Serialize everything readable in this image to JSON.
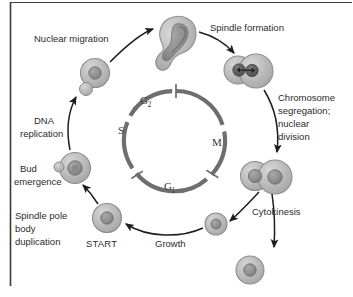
{
  "figure": {
    "background_color": "#ffffff",
    "border_color": "#3b3b3b"
  },
  "cycle_ring": {
    "name": "cell-cycle-ring",
    "color": "#6e6e6e",
    "tick_color": "#6e6e6e",
    "phases": [
      {
        "id": "g2",
        "label": "G",
        "subscript": "2"
      },
      {
        "id": "m",
        "label": "M",
        "subscript": ""
      },
      {
        "id": "g1",
        "label": "G",
        "subscript": "1"
      },
      {
        "id": "s",
        "label": "S",
        "subscript": ""
      }
    ]
  },
  "stage_labels": [
    {
      "id": "nuclear-migration",
      "lines": [
        "Nuclear migration"
      ]
    },
    {
      "id": "spindle-formation",
      "lines": [
        "Spindle formation"
      ]
    },
    {
      "id": "chromosome-segregation",
      "lines": [
        "Chromosome",
        "segregation;",
        "nuclear",
        "division"
      ]
    },
    {
      "id": "cytokinesis",
      "lines": [
        "Cytokinesis"
      ]
    },
    {
      "id": "growth",
      "lines": [
        "Growth"
      ]
    },
    {
      "id": "start",
      "lines": [
        "START"
      ]
    },
    {
      "id": "spindle-pole-body-duplication",
      "lines": [
        "Spindle pole",
        "body",
        "duplication"
      ]
    },
    {
      "id": "bud-emergence",
      "lines": [
        "Bud",
        "emergence"
      ]
    },
    {
      "id": "dna-replication",
      "lines": [
        "DNA",
        "replication"
      ]
    }
  ],
  "cells": [
    {
      "id": "cell-nuclear-migration-budded",
      "description": "budded cell, nucleus at neck"
    },
    {
      "id": "cell-spindle-formation",
      "description": "two-lobed cell with spindle"
    },
    {
      "id": "cell-post-division-pair",
      "description": "mother and daughter with separate nuclei"
    },
    {
      "id": "cell-daughter-single",
      "description": "small single daughter cell"
    },
    {
      "id": "cell-detached-daughter",
      "description": "detached daughter cell"
    },
    {
      "id": "cell-start",
      "description": "unbudded G1 cell at START"
    },
    {
      "id": "cell-bud-emergence",
      "description": "cell with emerging bud"
    },
    {
      "id": "cell-dna-replication",
      "description": "cell with small bud, S phase"
    }
  ],
  "colors": {
    "cell_fill": "#b9b9b9",
    "cell_edge": "#8c8c8c",
    "nucleus_fill": "#8f8f8f",
    "nucleus_edge": "#6a6a6a",
    "arrow": "#1d1d1d",
    "ring": "#6e6e6e"
  }
}
